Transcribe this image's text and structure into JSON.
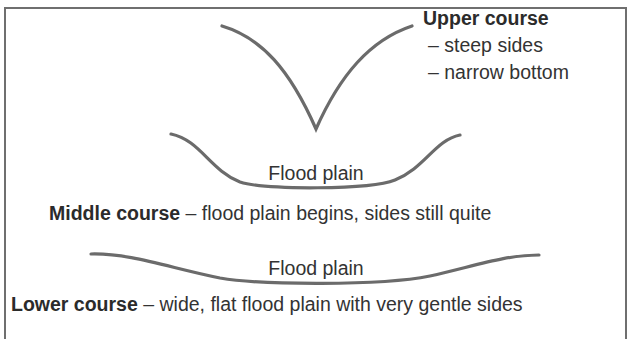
{
  "diagram": {
    "colors": {
      "line": "#6b6b6b",
      "text": "#333333",
      "border": "#6f6f6f"
    },
    "upper": {
      "heading": "Upper course",
      "points": [
        "– steep sides",
        "– narrow bottom"
      ]
    },
    "middle": {
      "floodplain_label": "Flood plain",
      "heading": "Middle course",
      "description": " – flood plain begins, sides still quite"
    },
    "lower": {
      "floodplain_label": "Flood plain",
      "heading": "Lower course",
      "description": " – wide, flat flood plain with very gentle sides"
    }
  }
}
